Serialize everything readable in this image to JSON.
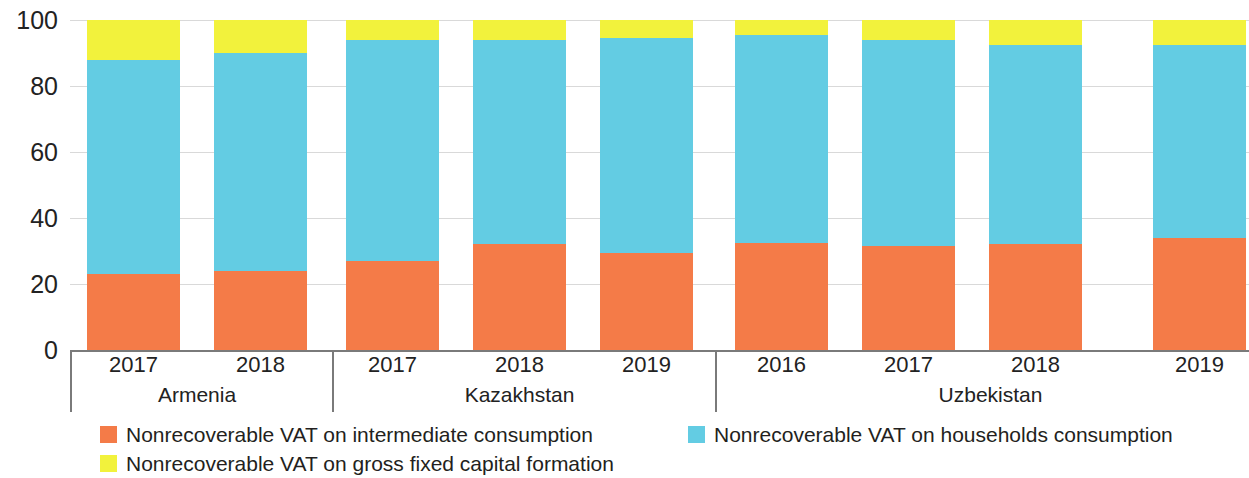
{
  "chart_data": {
    "type": "bar",
    "subtype": "stacked-percentage",
    "title": "",
    "xlabel": "",
    "ylabel": "",
    "ylim": [
      0,
      100
    ],
    "y_ticks": [
      0,
      20,
      40,
      60,
      80,
      100
    ],
    "y_tick_labels": [
      "0",
      "20",
      "40",
      "60",
      "80",
      "100"
    ],
    "grid": true,
    "grid_axis": "y",
    "legend_position": "bottom-left",
    "stack_order": [
      "intermediate",
      "households",
      "gfcf"
    ],
    "categories": [
      "Armenia 2017",
      "Armenia 2018",
      "Kazakhstan 2017",
      "Kazakhstan 2018",
      "Kazakhstan 2019",
      "Uzbekistan 2016",
      "Uzbekistan 2017",
      "Uzbekistan 2018",
      "Uzbekistan 2019"
    ],
    "series": [
      {
        "name": "Nonrecoverable VAT on intermediate consumption",
        "color": "#F47B48",
        "values": [
          23.0,
          24.0,
          27.0,
          32.0,
          29.5,
          32.5,
          31.5,
          32.0,
          34.0
        ]
      },
      {
        "name": "Nonrecoverable VAT on households consumption",
        "color": "#63CCE3",
        "values": [
          65.0,
          66.0,
          67.0,
          62.0,
          65.0,
          63.0,
          62.5,
          60.5,
          58.5
        ]
      },
      {
        "name": "Nonrecoverable VAT on gross fixed capital formation",
        "color": "#F2F23C",
        "values": [
          12.0,
          10.0,
          6.0,
          6.0,
          5.5,
          4.5,
          6.0,
          7.5,
          7.5
        ]
      }
    ],
    "groups": [
      {
        "country": "Armenia",
        "years": [
          "2017",
          "2018"
        ]
      },
      {
        "country": "Kazakhstan",
        "years": [
          "2017",
          "2018",
          "2019"
        ]
      },
      {
        "country": "Uzbekistan",
        "years": [
          "2016",
          "2017",
          "2018",
          "2019"
        ]
      }
    ]
  },
  "legend": {
    "items": [
      {
        "label": "Nonrecoverable VAT on intermediate consumption",
        "color": "#F47B48"
      },
      {
        "label": "Nonrecoverable VAT on households consumption",
        "color": "#63CCE3"
      },
      {
        "label": "Nonrecoverable VAT on gross fixed capital formation",
        "color": "#F2F23C"
      }
    ]
  },
  "colors": {
    "intermediate": "#F47B48",
    "households": "#63CCE3",
    "gfcf": "#F2F23C",
    "gridline": "#d9d9d9",
    "axis": "#7a7a7a",
    "text": "#231f20",
    "background": "#ffffff"
  }
}
